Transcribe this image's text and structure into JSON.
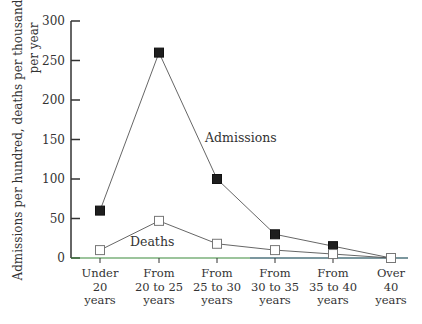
{
  "chart_data": {
    "type": "line",
    "title": "",
    "xlabel": "",
    "ylabel_line1": "Admissions per hundred, deaths per thousand",
    "ylabel_line2": "per year",
    "ylim": [
      0,
      300
    ],
    "yticks": [
      0,
      50,
      100,
      150,
      200,
      250,
      300
    ],
    "grid": false,
    "legend": "inline labels",
    "categories": [
      [
        "Under",
        "20",
        "years"
      ],
      [
        "From",
        "20 to 25",
        "years"
      ],
      [
        "From",
        "25 to 30",
        "years"
      ],
      [
        "From",
        "30 to 35",
        "years"
      ],
      [
        "From",
        "35 to 40",
        "years"
      ],
      [
        "Over",
        "40",
        "years"
      ]
    ],
    "series": [
      {
        "name": "Admissions",
        "marker": "filled-square",
        "values": [
          60,
          260,
          100,
          30,
          15,
          0
        ]
      },
      {
        "name": "Deaths",
        "marker": "open-square",
        "values": [
          10,
          47,
          18,
          10,
          5,
          0
        ]
      }
    ],
    "colors": {
      "axis": "#333333",
      "baseline": "#3a8a3a",
      "line": "#555555",
      "filled_marker": "#1e1e1e"
    }
  }
}
